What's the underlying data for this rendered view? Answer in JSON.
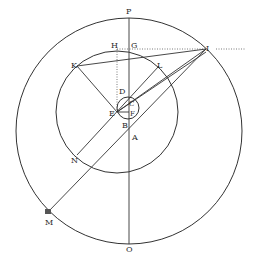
{
  "figure": {
    "background": "#ffffff",
    "ink": "#333333",
    "labels": {
      "P": "P",
      "H": "H",
      "G": "G",
      "I": "I",
      "K": "K",
      "L": "L",
      "D": "D",
      "C": "C",
      "E": "E",
      "F": "F",
      "B": "B",
      "A": "A",
      "N": "N",
      "M": "M",
      "O": "O"
    },
    "circles": [
      {
        "name": "outer-circle",
        "cx": 129,
        "cy": 131,
        "r": 113
      },
      {
        "name": "inner-circle",
        "cx": 117,
        "cy": 112,
        "r": 61
      },
      {
        "name": "small-circle",
        "cx": 128,
        "cy": 108,
        "r": 11
      }
    ]
  }
}
